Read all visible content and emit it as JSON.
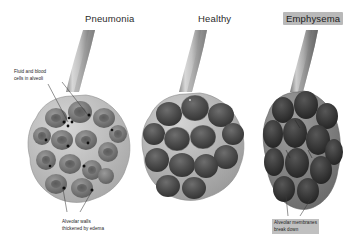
{
  "figure": {
    "type": "medical-illustration",
    "background_color": "#ffffff",
    "panels": [
      {
        "id": "pneumonia",
        "title": "Pneumonia",
        "title_highlighted": false,
        "description": "Alveolar cluster with thickened pale walls, fluid-filled cavities and dark blood cells"
      },
      {
        "id": "healthy",
        "title": "Healthy",
        "title_highlighted": false,
        "description": "Alveolar cluster with thin walls and clear open air spaces"
      },
      {
        "id": "emphysema",
        "title": "Emphysema",
        "title_highlighted": true,
        "description": "Distended darkened alveoli with broken-down merged membranes"
      }
    ],
    "annotations": [
      {
        "id": "fluid-blood-cells",
        "text": "Fluid and blood\ncells in alveoli",
        "highlighted": false,
        "panel": "pneumonia"
      },
      {
        "id": "thickened-walls",
        "text": "Alveolar walls\nthickened by edema",
        "highlighted": false,
        "panel": "pneumonia"
      },
      {
        "id": "membranes-break-down",
        "text": "Alveolar membranes\nbreak down",
        "highlighted": true,
        "panel": "emphysema"
      }
    ],
    "colors": {
      "background": "#ffffff",
      "tube_light": "#e2e2e2",
      "tube_dark": "#6a6a6a",
      "wall_light": "#c9c9c9",
      "cavity_dark": "#5a5a5a",
      "cavity_darkest": "#2e2e2e",
      "blood_cell": "#111111",
      "leader_line": "#3a3a3a",
      "highlight_box": "#bcbcbc",
      "text": "#1c1c1c"
    }
  }
}
